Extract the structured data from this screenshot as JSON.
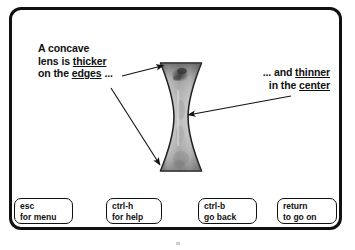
{
  "screen": {
    "background_color": "#ffffff",
    "frame_color": "#111111"
  },
  "annotations": {
    "left": {
      "line1": "A concave",
      "line2_prefix": "lens is ",
      "line2_underlined": "thicker",
      "line3_prefix": "on the ",
      "line3_underlined": "edges",
      "line3_suffix": " ..."
    },
    "right": {
      "line1_prefix": "... and ",
      "line1_underlined": "thinner",
      "line2_prefix": "in the ",
      "line2_underlined": "center"
    }
  },
  "illustration": {
    "name": "concave-lens",
    "description": "concave lens shown as an hourglass shape, thick at top and bottom edges, thin in the center",
    "fill_light": "#d8d8d8",
    "fill_mid": "#a9a9a9",
    "fill_dark": "#5a5a5a",
    "outline_color": "#1a1a1a"
  },
  "arrows": [
    {
      "name": "arrow-to-top-edge",
      "from_label": "left annotation",
      "to_target": "lens top edge"
    },
    {
      "name": "arrow-to-bottom-edge",
      "from_label": "left annotation",
      "to_target": "lens bottom edge"
    },
    {
      "name": "arrow-to-center",
      "from_label": "right annotation",
      "to_target": "lens center"
    }
  ],
  "buttons": [
    {
      "name": "esc-for-menu",
      "key": "esc",
      "action": "for menu"
    },
    {
      "name": "ctrl-h-for-help",
      "key": "ctrl-h",
      "action": "for help"
    },
    {
      "name": "ctrl-b-go-back",
      "key": "ctrl-b",
      "action": "go back"
    },
    {
      "name": "return-to-go-on",
      "key": "return",
      "action": "to go on"
    }
  ]
}
